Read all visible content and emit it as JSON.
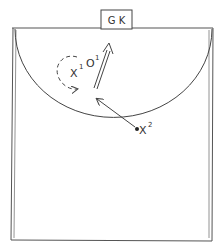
{
  "diagram": {
    "colors": {
      "line": "#444444",
      "background": "#ffffff"
    },
    "goal_box": {
      "label": "G K"
    },
    "players": [
      {
        "id": "x1",
        "symbol": "X",
        "superscript": "1"
      },
      {
        "id": "o1",
        "symbol": "O",
        "superscript": "1"
      },
      {
        "id": "x2",
        "symbol": "X",
        "superscript": "2"
      }
    ],
    "movements": [
      {
        "type": "dashed-curve-run",
        "player": "x1"
      },
      {
        "type": "double-line-run",
        "player": "o1"
      },
      {
        "type": "pass",
        "from": "x2"
      }
    ]
  }
}
